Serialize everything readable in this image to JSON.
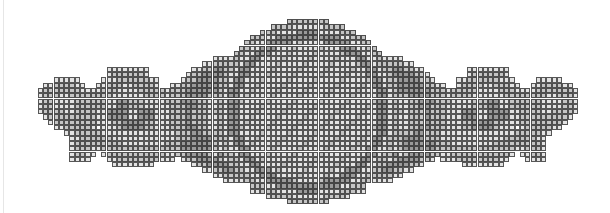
{
  "pattern": {
    "title": "Ornamental medallion cross-stitch chart",
    "cell_size_px": 5.3,
    "cols": 106,
    "rows": 35,
    "legend": {
      ".": "empty",
      "0": "white stitch",
      "1": "light gray",
      "2": "medium gray",
      "3": "dark gray",
      "4": "darkest gray"
    },
    "colors": {
      "0": "#ffffff",
      "1": "#e3e3e3",
      "2": "#c4c4c4",
      "3": "#9a9a9a",
      "4": "#7a7a7a",
      "grid": "#282828"
    },
    "regions": [
      "left-vine",
      "left-flower",
      "left-wing",
      "center-medallion",
      "right-wing",
      "right-flower",
      "right-vine"
    ],
    "left_half_rows": [
      ".............................................1111111",
      "..........................................11113333333",
      "..........................................3333333333",
      "...................................1111.113331111111",
      ".................................11222111333111111111",
      "...............11111111........1122332123311111111111",
      "...............12222221.......12233332132111111111111",
      ".....11111....11122222211....1223333213211111111111111",
      "...11222211..112221122221..11223333321321111111111111",
      "..12222222111122211112222212223333332132111111111111111",
      "..1222112222222211111122221222333322213211111111111111",
      "..12211112222221133222111122233322112321111111111111111",
      "..12211112222221133222111112223322112321111111111111111",
      "..12222112222113333113331112223222112321111111111111111",
      "...1222222222113333113331112223222112321111111111111111",
      "....12222222211122333322111222322211232111111111111111",
      ".....11222221011123333221112223322112321111111111111111",
      ".......1122222111111111111112223322213211111111111111111",
      "........112222221111111111112223333213211111111111111111",
      "........122222222211111111222333333213211111111111111111",
      "........1222112222222222222223333332132111111111111111",
      "........12211.1222222222221122333321321111111111111111",
      "........1111...1122222222111.1223333213211111111111111",
      "................11111111.......12233332132111111111111",
      ".................................1122332123311111111111",
      "...................................11222111333111111111",
      ".....................................1111.113331111111",
      "..........................................3333333333",
      "..........................................11113333333",
      ".............................................1111111"
    ]
  }
}
